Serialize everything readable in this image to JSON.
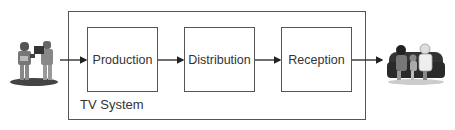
{
  "diagram": {
    "container": {
      "label": "TV System"
    },
    "stages": [
      {
        "label": "Production"
      },
      {
        "label": "Distribution"
      },
      {
        "label": "Reception"
      }
    ],
    "source": {
      "icon": "camera-crew-icon",
      "description": "film crew with camera"
    },
    "sink": {
      "icon": "audience-on-couch-icon",
      "description": "family watching on couch"
    },
    "flow": [
      "camera-crew",
      "Production",
      "Distribution",
      "Reception",
      "audience"
    ]
  }
}
